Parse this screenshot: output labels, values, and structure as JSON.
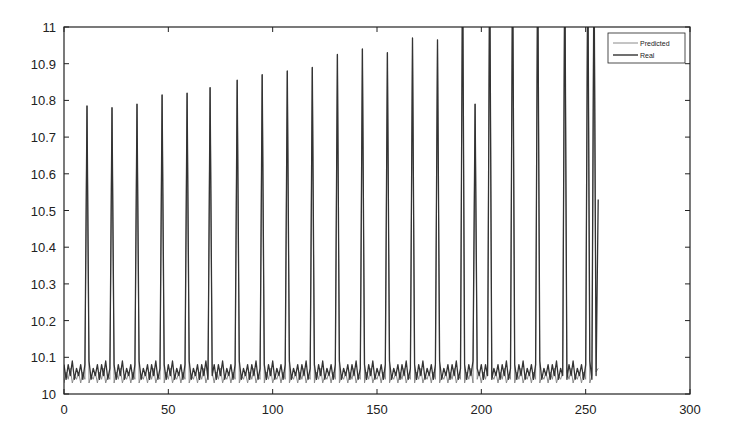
{
  "chart_data": {
    "type": "line",
    "title": "",
    "xlabel": "",
    "ylabel": "",
    "xlim": [
      0,
      300
    ],
    "ylim": [
      10,
      11
    ],
    "grid": false,
    "legend_position": "upper right",
    "xticks": [
      0,
      50,
      100,
      150,
      200,
      250,
      300
    ],
    "xtick_labels": [
      "0",
      "50",
      "100",
      "150",
      "200",
      "250",
      "300"
    ],
    "yticks": [
      10,
      10.1,
      10.2,
      10.3,
      10.4,
      10.5,
      10.6,
      10.7,
      10.8,
      10.9,
      11
    ],
    "ytick_labels": [
      "10",
      "10.1",
      "10.2",
      "10.3",
      "10.4",
      "10.5",
      "10.6",
      "10.7",
      "10.8",
      "10.9",
      "11"
    ],
    "peaks": {
      "x": [
        11,
        23,
        35,
        47,
        59,
        70,
        83,
        95,
        107,
        119,
        131,
        143,
        155,
        167,
        179,
        191,
        197,
        204,
        215,
        227,
        240,
        251,
        254
      ],
      "y": [
        10.785,
        10.78,
        10.79,
        10.815,
        10.82,
        10.835,
        10.855,
        10.87,
        10.88,
        10.89,
        10.925,
        10.94,
        10.93,
        10.97,
        10.965,
        11.2,
        10.79,
        11.2,
        11.2,
        11.2,
        11.2,
        11.2,
        11.2
      ]
    },
    "series": [
      {
        "name": "Predicted",
        "color": "#8a8a8a",
        "baseline_pattern": [
          10.03,
          10.06,
          10.04,
          10.07,
          10.03,
          10.05,
          10.04,
          10.06
        ],
        "end_x": 256,
        "end_y": 10.07
      },
      {
        "name": "Real",
        "color": "#333333",
        "baseline_pattern": [
          10.05,
          10.08,
          10.04,
          10.08,
          10.05,
          10.09,
          10.04,
          10.07
        ],
        "end_x": 256,
        "end_y": 10.53
      }
    ]
  },
  "legend": {
    "items": [
      {
        "label": "Predicted",
        "color": "#8a8a8a"
      },
      {
        "label": "Real",
        "color": "#333333"
      }
    ]
  }
}
